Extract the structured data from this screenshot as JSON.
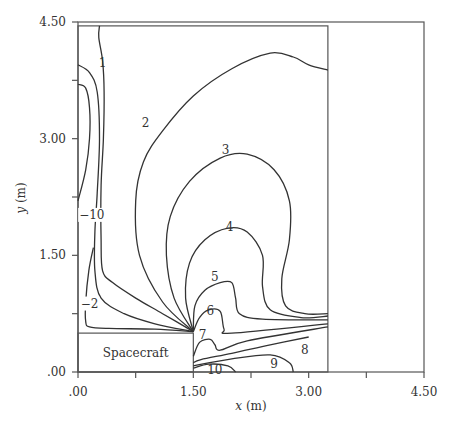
{
  "chart_data": {
    "type": "contour",
    "title": "",
    "xlabel_var": "x",
    "xlabel_unit": "(m)",
    "ylabel_var": "y",
    "ylabel_unit": "(m)",
    "xlim": [
      0,
      4.5
    ],
    "ylim": [
      0,
      4.5
    ],
    "x_ticks": [
      0,
      0.75,
      1.5,
      2.25,
      3.0,
      3.75,
      4.5
    ],
    "x_tick_labels": [
      ".00",
      "",
      "1.50",
      "",
      "3.00",
      "",
      "4.50"
    ],
    "y_ticks": [
      0,
      0.75,
      1.5,
      2.25,
      3.0,
      3.75,
      4.5
    ],
    "y_tick_labels": [
      ".00",
      "",
      "1.50",
      "",
      "3.00",
      "",
      "4.50"
    ],
    "grid": false,
    "annotation": "Spacecraft",
    "spacecraft_region": {
      "x": [
        0,
        1.5
      ],
      "y": [
        0,
        0.5
      ]
    },
    "domain_box": {
      "x": [
        0,
        3.25
      ],
      "y": [
        0,
        4.45
      ]
    },
    "contours": [
      {
        "level": "1",
        "label_at": [
          0.32,
          3.97
        ],
        "points": [
          [
            0.28,
            4.45
          ],
          [
            0.27,
            4.3
          ],
          [
            0.32,
            4.0
          ],
          [
            0.34,
            3.6
          ],
          [
            0.33,
            3.0
          ],
          [
            0.3,
            2.4
          ],
          [
            0.3,
            1.7
          ],
          [
            0.32,
            1.3
          ],
          [
            0.45,
            1.15
          ],
          [
            0.75,
            0.95
          ],
          [
            1.1,
            0.75
          ],
          [
            1.5,
            0.52
          ]
        ]
      },
      {
        "level": "-10",
        "label_at": [
          0.18,
          2.02
        ],
        "points": [
          [
            0,
            3.95
          ],
          [
            0.15,
            3.85
          ],
          [
            0.25,
            3.6
          ],
          [
            0.28,
            3.0
          ],
          [
            0.25,
            2.3
          ],
          [
            0.22,
            1.8
          ],
          [
            0.22,
            1.3
          ],
          [
            0.3,
            0.95
          ],
          [
            0.6,
            0.75
          ],
          [
            1.0,
            0.62
          ],
          [
            1.5,
            0.52
          ]
        ]
      },
      {
        "level": "-20",
        "label_at": null,
        "points": [
          [
            0,
            3.7
          ],
          [
            0.1,
            3.65
          ],
          [
            0.15,
            3.4
          ],
          [
            0.15,
            3.0
          ],
          [
            0.1,
            2.6
          ],
          [
            0,
            2.2
          ]
        ]
      },
      {
        "level": "-2",
        "label_at": [
          0.15,
          0.88
        ],
        "points": [
          [
            0.2,
            1.6
          ],
          [
            0.14,
            1.3
          ],
          [
            0.1,
            0.9
          ],
          [
            0.1,
            0.65
          ],
          [
            0.15,
            0.58
          ],
          [
            0.4,
            0.56
          ],
          [
            1.0,
            0.55
          ],
          [
            1.5,
            0.52
          ]
        ]
      },
      {
        "level": "2",
        "label_at": [
          0.88,
          3.2
        ],
        "points": [
          [
            1.5,
            0.52
          ],
          [
            1.1,
            0.9
          ],
          [
            0.8,
            1.5
          ],
          [
            0.75,
            2.2
          ],
          [
            0.85,
            2.7
          ],
          [
            1.1,
            3.1
          ],
          [
            1.5,
            3.55
          ],
          [
            2.0,
            3.9
          ],
          [
            2.5,
            4.1
          ],
          [
            2.8,
            4.05
          ],
          [
            3.0,
            3.95
          ],
          [
            3.25,
            3.88
          ]
        ]
      },
      {
        "level": "3",
        "label_at": [
          1.92,
          2.85
        ],
        "points": [
          [
            1.5,
            0.52
          ],
          [
            1.25,
            0.95
          ],
          [
            1.15,
            1.5
          ],
          [
            1.2,
            2.0
          ],
          [
            1.45,
            2.45
          ],
          [
            1.85,
            2.75
          ],
          [
            2.2,
            2.8
          ],
          [
            2.55,
            2.6
          ],
          [
            2.75,
            2.2
          ],
          [
            2.75,
            1.7
          ],
          [
            2.65,
            1.2
          ],
          [
            2.7,
            0.85
          ],
          [
            2.95,
            0.75
          ],
          [
            3.25,
            0.75
          ]
        ]
      },
      {
        "level": "4",
        "label_at": [
          1.97,
          1.87
        ],
        "points": [
          [
            1.5,
            0.52
          ],
          [
            1.4,
            0.95
          ],
          [
            1.45,
            1.4
          ],
          [
            1.65,
            1.7
          ],
          [
            1.95,
            1.85
          ],
          [
            2.2,
            1.8
          ],
          [
            2.4,
            1.5
          ],
          [
            2.4,
            1.1
          ],
          [
            2.5,
            0.8
          ],
          [
            2.9,
            0.7
          ],
          [
            3.25,
            0.72
          ]
        ]
      },
      {
        "level": "5",
        "label_at": [
          1.78,
          1.22
        ],
        "points": [
          [
            1.5,
            0.52
          ],
          [
            1.52,
            0.85
          ],
          [
            1.65,
            1.05
          ],
          [
            1.85,
            1.15
          ],
          [
            2.0,
            1.15
          ],
          [
            2.05,
            0.95
          ],
          [
            2.1,
            0.75
          ],
          [
            2.4,
            0.68
          ],
          [
            3.25,
            0.67
          ]
        ]
      },
      {
        "level": "6",
        "label_at": [
          1.72,
          0.78
        ],
        "points": [
          [
            1.5,
            0.52
          ],
          [
            1.58,
            0.7
          ],
          [
            1.7,
            0.8
          ],
          [
            1.85,
            0.78
          ],
          [
            1.9,
            0.55
          ],
          [
            2.0,
            0.5
          ],
          [
            3.25,
            0.62
          ]
        ]
      },
      {
        "level": "7",
        "label_at": [
          1.62,
          0.47
        ],
        "points": [
          [
            1.5,
            0.2
          ],
          [
            1.58,
            0.38
          ],
          [
            1.72,
            0.42
          ],
          [
            1.78,
            0.35
          ],
          [
            1.85,
            0.28
          ],
          [
            2.2,
            0.4
          ],
          [
            3.25,
            0.58
          ]
        ]
      },
      {
        "level": "8",
        "label_at": [
          2.95,
          0.28
        ],
        "points": [
          [
            1.5,
            0.12
          ],
          [
            1.6,
            0.16
          ],
          [
            2.0,
            0.24
          ],
          [
            2.5,
            0.35
          ],
          [
            3.0,
            0.45
          ]
        ]
      },
      {
        "level": "9",
        "label_at": [
          2.55,
          0.1
        ],
        "points": [
          [
            1.5,
            0.08
          ],
          [
            2.0,
            0.17
          ],
          [
            2.5,
            0.22
          ],
          [
            2.75,
            0.12
          ],
          [
            2.8,
            0.0
          ]
        ]
      },
      {
        "level": "10",
        "label_at": [
          1.78,
          0.02
        ],
        "points": [
          [
            1.5,
            0.05
          ],
          [
            1.7,
            0.1
          ],
          [
            1.95,
            0.08
          ],
          [
            2.05,
            0.0
          ]
        ]
      }
    ]
  }
}
